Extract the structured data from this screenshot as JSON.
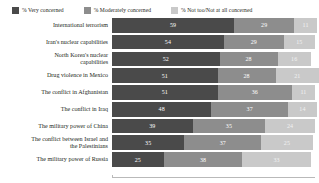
{
  "legend": {
    "items": [
      {
        "label": "% Very concerned",
        "color": "#4a4a4a",
        "name": "very-concerned"
      },
      {
        "label": "% Moderately concerned",
        "color": "#8d8d8d",
        "name": "moderately-concerned"
      },
      {
        "label": "% Not too/Not at all concerned",
        "color": "#c9c9c9",
        "name": "not-concerned"
      }
    ]
  },
  "chart_data": {
    "type": "bar",
    "orientation": "horizontal",
    "stacked": true,
    "percent": true,
    "title": "",
    "subtitle": "",
    "xlabel": "",
    "ylabel": "",
    "xlim": [
      0,
      100
    ],
    "grid": false,
    "legend_position": "top",
    "categories": [
      "International terrorism",
      "Iran's nuclear capabilities",
      "North Korea's nuclear capabilities",
      "Drug violence in Mexico",
      "The conflict in Afghanistan",
      "The conflict in Iraq",
      "The military power of China",
      "The conflict between Israel and the Palestinians",
      "The military power of Russia"
    ],
    "series": [
      {
        "name": "% Very concerned",
        "color": "#4a4a4a",
        "values": [
          59,
          54,
          52,
          51,
          51,
          48,
          39,
          35,
          25
        ]
      },
      {
        "name": "% Moderately concerned",
        "color": "#8d8d8d",
        "values": [
          29,
          29,
          28,
          28,
          36,
          37,
          35,
          37,
          38
        ]
      },
      {
        "name": "% Not too/Not at all concerned",
        "color": "#c9c9c9",
        "values": [
          11,
          15,
          16,
          21,
          11,
          14,
          24,
          25,
          33
        ]
      }
    ],
    "rows": [
      {
        "label_line1": "International terrorism",
        "label_line2": "",
        "v1": 59,
        "v2": 29,
        "v3": 11
      },
      {
        "label_line1": "Iran's nuclear capabilities",
        "label_line2": "",
        "v1": 54,
        "v2": 29,
        "v3": 15
      },
      {
        "label_line1": "North Korea's nuclear",
        "label_line2": "capabilities",
        "v1": 52,
        "v2": 28,
        "v3": 16
      },
      {
        "label_line1": "Drug violence in Mexico",
        "label_line2": "",
        "v1": 51,
        "v2": 28,
        "v3": 21
      },
      {
        "label_line1": "The conflict in Afghanistan",
        "label_line2": "",
        "v1": 51,
        "v2": 36,
        "v3": 11
      },
      {
        "label_line1": "The conflict in Iraq",
        "label_line2": "",
        "v1": 48,
        "v2": 37,
        "v3": 14
      },
      {
        "label_line1": "The military power of China",
        "label_line2": "",
        "v1": 39,
        "v2": 35,
        "v3": 24
      },
      {
        "label_line1": "The conflict between Israel and",
        "label_line2": "the Palestinians",
        "v1": 35,
        "v2": 37,
        "v3": 25
      },
      {
        "label_line1": "The military power of Russia",
        "label_line2": "",
        "v1": 25,
        "v2": 38,
        "v3": 33
      }
    ]
  }
}
